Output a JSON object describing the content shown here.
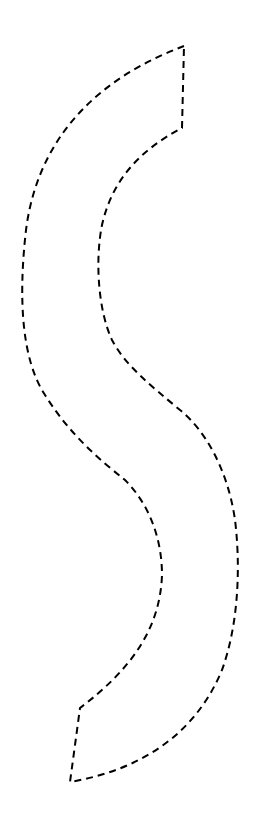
{
  "diagram": {
    "shape": "s-curve-band",
    "stroke_color": "#000000",
    "background_color": "#ffffff",
    "line_style": "dashed"
  }
}
